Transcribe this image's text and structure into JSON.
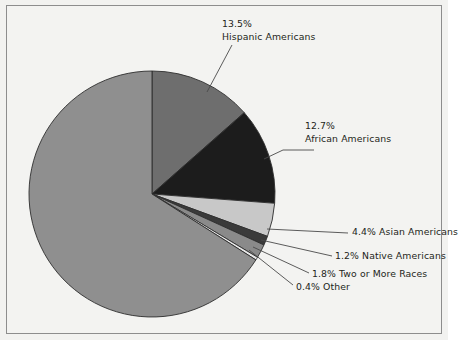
{
  "chart_data": {
    "type": "pie",
    "title": "",
    "categories": [
      "White Americans",
      "Hispanic Americans",
      "African Americans",
      "Asian Americans",
      "Native Americans",
      "Two or More Races",
      "Other"
    ],
    "values": [
      66.0,
      13.5,
      12.7,
      4.4,
      1.2,
      1.8,
      0.4
    ],
    "units": "%",
    "legend": "none",
    "labels_shown": [
      "13.5% Hispanic Americans",
      "12.7% African Americans",
      "4.4% Asian Americans",
      "1.2% Native Americans",
      "1.8% Two or More Races",
      "0.4% Other"
    ],
    "slice_colors": [
      "#8f8f8f",
      "#6e6e6e",
      "#1c1c1c",
      "#c8c8c8",
      "#3a3a3a",
      "#8a8a8a",
      "#e8e8e8"
    ],
    "start_angle_deg": 0,
    "direction": "clockwise"
  },
  "figure": {
    "background": "#f3f3f1",
    "border_color": "#8d8d8d",
    "leader_line_color": "#4a4a4a",
    "text_color": "#231f20"
  },
  "slices": {
    "hispanic": {
      "pct": "13.5%",
      "name": "Hispanic Americans"
    },
    "african": {
      "pct": "12.7%",
      "name": "African Americans"
    },
    "asian": {
      "pct": "4.4%",
      "name": "Asian Americans"
    },
    "native": {
      "pct": "1.2%",
      "name": "Native Americans"
    },
    "two_or_more": {
      "pct": "1.8%",
      "name": "Two or More Races"
    },
    "other": {
      "pct": "0.4%",
      "name": "Other"
    },
    "white": {
      "pct": "66.0%",
      "name": "White Americans"
    }
  }
}
